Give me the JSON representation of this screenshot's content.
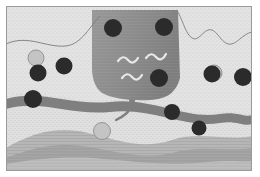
{
  "figure": {
    "frame": {
      "x": 6,
      "y": 6,
      "width": 246,
      "height": 165,
      "border_color": "#9a9a9a",
      "background_color": "#ffffff"
    },
    "colors": {
      "host_rock_light": "#e2e2e2",
      "host_rock_stipple": "#c9c9c9",
      "intrusion_body": "#8f8f8f",
      "intrusion_body_dark": "#7a7a7a",
      "fault_band": "#7f7f7f",
      "basal_layer_mid": "#b4b4b4",
      "basal_layer_dark": "#a2a2a2",
      "basal_layer_bottom": "#bdbdbd",
      "clast_dark": "#2b2b2b",
      "clast_light": "#c4c4c4",
      "squiggle": "#e8e8e8",
      "thin_line": "#6f6f6f"
    },
    "layers": [
      {
        "name": "upper-host-rock",
        "label": "Upper host rock (stippled)",
        "fill": "#e2e2e2"
      },
      {
        "name": "intrusion-body",
        "label": "Central intrusive body",
        "fill": "#8f8f8f"
      },
      {
        "name": "fault-band",
        "label": "Wavy fault / shear band",
        "fill": "#7f7f7f"
      },
      {
        "name": "lower-host-rock",
        "label": "Lower host rock",
        "fill": "#e2e2e2"
      },
      {
        "name": "basal-layer",
        "label": "Basal layered unit",
        "fill": "#b4b4b4"
      }
    ],
    "clasts_dark": [
      {
        "cx": 38,
        "cy": 73,
        "r": 8.5
      },
      {
        "cx": 33,
        "cy": 99,
        "r": 9.0
      },
      {
        "cx": 64,
        "cy": 66,
        "r": 8.5
      },
      {
        "cx": 113,
        "cy": 28,
        "r": 9.0
      },
      {
        "cx": 164,
        "cy": 27,
        "r": 9.0
      },
      {
        "cx": 159,
        "cy": 78,
        "r": 9.0
      },
      {
        "cx": 172,
        "cy": 112,
        "r": 8.0
      },
      {
        "cx": 199,
        "cy": 128,
        "r": 7.5
      },
      {
        "cx": 212,
        "cy": 74,
        "r": 8.5
      },
      {
        "cx": 243,
        "cy": 77,
        "r": 9.0
      }
    ],
    "clasts_light": [
      {
        "cx": 36,
        "cy": 58,
        "r": 8.0
      },
      {
        "cx": 102,
        "cy": 131,
        "r": 8.5
      },
      {
        "cx": 214,
        "cy": 73,
        "r": 8.0
      }
    ],
    "squiggles": [
      {
        "name": "squiggle-left",
        "d": "M118 61 q5 -7 10 -1 q5 6 10 -2"
      },
      {
        "name": "squiggle-right",
        "d": "M146 58 q5 -7 10 -1 q5 6 10 -3"
      },
      {
        "name": "squiggle-bottom",
        "d": "M122 78 q5 -7 10 -1 q5 6 10 -2"
      }
    ],
    "annotations": {
      "branch": "root-like branch from intrusion into fault band",
      "scallop": "scalloped contact on right side of intrusion",
      "thin_curve": "thin bedding contact in upper-left host rock"
    }
  }
}
